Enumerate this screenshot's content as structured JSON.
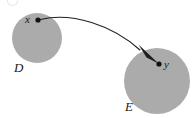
{
  "figure": {
    "background_color": "#ffffff",
    "width": 195,
    "height": 118
  },
  "sets": [
    {
      "id": "D",
      "label": "D",
      "shape": "circle",
      "fill_color": "#ababab",
      "center_x": 37,
      "center_y": 38,
      "radius": 25
    },
    {
      "id": "E",
      "label": "E",
      "shape": "circle",
      "fill_color": "#ababab",
      "center_x": 157,
      "center_y": 81,
      "radius": 33
    }
  ],
  "points": [
    {
      "id": "x",
      "label": "x",
      "in_set": "D",
      "x": 38,
      "y": 20,
      "dot_color": "#111111",
      "dot_radius": 2.6
    },
    {
      "id": "y",
      "label": "y",
      "in_set": "E",
      "x": 159,
      "y": 64,
      "dot_color": "#111111",
      "dot_radius": 2.6
    }
  ],
  "arrow": {
    "from": "x",
    "to": "y",
    "style": "curved",
    "stroke_color": "#1f1f1f",
    "stroke_width": 1.1,
    "head": "filled-triangle",
    "path": "M 40.5 19.5 C 72 12, 112 25, 140 50",
    "head_points": "159,64 139,45 147,57"
  },
  "corner_mark": {
    "name": "partial-clipped-glyph",
    "visible": true,
    "color": "#d2d2d2"
  }
}
